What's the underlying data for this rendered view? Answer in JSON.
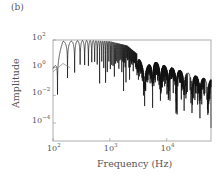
{
  "panel_label": "(b)",
  "chart_data": {
    "type": "line",
    "title": "",
    "xlabel": "Frequency (Hz)",
    "ylabel": "Amplitude",
    "xscale": "log",
    "yscale": "log",
    "xlim": [
      100,
      60000
    ],
    "ylim": [
      5e-06,
      100
    ],
    "xticks": [
      {
        "base": "10",
        "exp": "2"
      },
      {
        "base": "10",
        "exp": "3"
      },
      {
        "base": "10",
        "exp": "4"
      }
    ],
    "yticks": [
      {
        "base": "10",
        "exp": "2"
      },
      {
        "base": "10",
        "exp": "0"
      },
      {
        "base": "10",
        "exp": "−2"
      },
      {
        "base": "10",
        "exp": "−4"
      }
    ],
    "grid": false,
    "legend": null,
    "series": [
      {
        "name": "amplitude spectrum (upper envelope)",
        "description": "Dense oscillating spectrum: peaks near 10^2 from ~150 Hz to ~2 kHz, then lobed decay with peaks near 10^0 at ~6 kHz, dropping to ~10^-1 by 60 kHz; nulls reach below 10^-4.",
        "x": [
          100,
          150,
          200,
          300,
          500,
          1000,
          2000,
          3000,
          4000,
          6000,
          9000,
          15000,
          25000,
          40000,
          60000
        ],
        "y": [
          1,
          80,
          80,
          90,
          90,
          80,
          40,
          10,
          1,
          3,
          1.5,
          0.8,
          0.4,
          0.2,
          0.15
        ]
      },
      {
        "name": "secondary curve (grey)",
        "x": [
          100,
          150,
          200
        ],
        "y": [
          0.5,
          2,
          1
        ]
      }
    ]
  }
}
